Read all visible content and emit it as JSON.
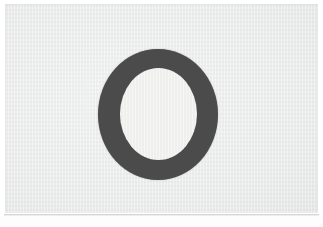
{
  "image": {
    "subject_name": "ring-annulus",
    "subject_description": "Dark gray ring (annulus) shape centered on a light gray scanned paper background",
    "background_name": "scanned-paper",
    "orientation": "landscape",
    "width_px": 323,
    "height_px": 227
  },
  "colors": {
    "page_white": "#ffffff",
    "paper_gray": "#e9eaea",
    "ring_dark_gray": "#4b4b4c",
    "ring_hole_white": "#f2f2f1",
    "rule_gray": "#d5d6d6",
    "footer_white": "#fdfdfd"
  },
  "geometry": {
    "paper": {
      "left": 5,
      "top": 4,
      "width": 313,
      "height": 209
    },
    "ring_outer": {
      "left": 98,
      "top": 49,
      "width": 120,
      "height": 131
    },
    "ring_hole": {
      "left": 120,
      "top": 68,
      "width": 77,
      "height": 92
    },
    "ring_stroke_px": 22,
    "bottom_rule": {
      "left": 4,
      "top": 214,
      "width": 315,
      "height": 1
    }
  },
  "labels": {
    "alt_text": "Dark gray ring shape on light gray scanned paper"
  }
}
